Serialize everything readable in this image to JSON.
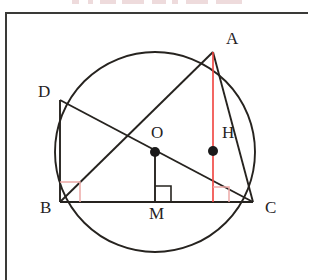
{
  "figure": {
    "kind": "euclidean-geometry-diagram",
    "colors": {
      "stroke": "#26231f",
      "accent_red": "#f0403c",
      "accent_pink": "#eda9a6",
      "frame": "#3a3a38",
      "background": "#ffffff",
      "point_fill": "#1a1a1a"
    },
    "circle": {
      "center_label": "O",
      "cx": 155,
      "cy": 152,
      "r": 100
    },
    "points": [
      {
        "name": "A",
        "label": "A",
        "x": 213,
        "y": 52,
        "label_x": 226,
        "label_y": 30,
        "dot": false
      },
      {
        "name": "B",
        "label": "B",
        "x": 60,
        "y": 202,
        "label_x": 40,
        "label_y": 199,
        "dot": false
      },
      {
        "name": "C",
        "label": "C",
        "x": 253,
        "y": 202,
        "label_x": 265,
        "label_y": 199,
        "dot": false
      },
      {
        "name": "D",
        "label": "D",
        "x": 60,
        "y": 100,
        "label_x": 38,
        "label_y": 83,
        "dot": false
      },
      {
        "name": "O",
        "label": "O",
        "x": 155,
        "y": 152,
        "label_x": 151,
        "label_y": 124,
        "dot": true
      },
      {
        "name": "H",
        "label": "H",
        "x": 213,
        "y": 151,
        "label_x": 222,
        "label_y": 124,
        "dot": true
      },
      {
        "name": "M",
        "label": "M",
        "x": 155,
        "y": 202,
        "label_x": 149,
        "label_y": 205,
        "dot": false
      }
    ],
    "segments": [
      {
        "name": "BC",
        "from": "B",
        "to": "C",
        "color": "stroke",
        "note": "base chord"
      },
      {
        "name": "BA",
        "from": "B",
        "to": "A",
        "color": "stroke"
      },
      {
        "name": "AC",
        "from": "A",
        "to": "C",
        "color": "stroke"
      },
      {
        "name": "BD",
        "from": "B",
        "to": "D",
        "color": "stroke",
        "note": "vertical"
      },
      {
        "name": "DC",
        "from": "D",
        "to": "C",
        "color": "stroke",
        "note": "diameter through O"
      },
      {
        "name": "OM",
        "from": "O",
        "to": "M",
        "color": "stroke",
        "note": "perpendicular to BC"
      },
      {
        "name": "AH",
        "from": "A",
        "to": "foot-on-BC",
        "color": "accent_red",
        "note": "altitude, vertical red"
      }
    ],
    "right_angle_marks": [
      {
        "name": "angle-at-B",
        "at": "B",
        "color": "accent_pink"
      },
      {
        "name": "angle-at-M",
        "at": "M",
        "color": "stroke"
      },
      {
        "name": "angle-at-altitude-foot",
        "at": "AH-foot",
        "color": "accent_pink"
      }
    ],
    "labels": {
      "A": "A",
      "B": "B",
      "C": "C",
      "D": "D",
      "O": "O",
      "H": "H",
      "M": "M"
    }
  }
}
